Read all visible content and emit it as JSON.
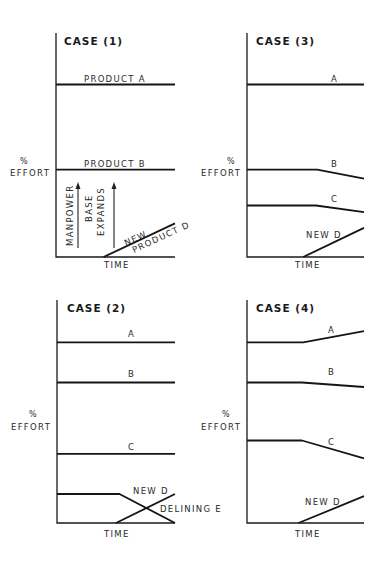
{
  "figure": {
    "y_label_symbol": "%",
    "y_label_text": "EFFORT",
    "x_label": "TIME",
    "note": "Time axis normalized 0..1; effort values normalized 0..1 of panel height"
  },
  "chart_data": [
    {
      "type": "line",
      "title": "CASE (1)",
      "xlabel": "TIME",
      "ylabel": "% EFFORT",
      "xlim": [
        0,
        1
      ],
      "ylim": [
        0,
        1
      ],
      "series": [
        {
          "name": "PRODUCT A",
          "label": "PRODUCT A",
          "points": [
            [
              0,
              0.77
            ],
            [
              1,
              0.77
            ]
          ]
        },
        {
          "name": "PRODUCT B",
          "label": "PRODUCT B",
          "points": [
            [
              0,
              0.39
            ],
            [
              1,
              0.39
            ]
          ]
        },
        {
          "name": "NEW PRODUCT D",
          "label_line1": "NEW",
          "label_line2": "PRODUCT D",
          "points": [
            [
              0.4,
              0
            ],
            [
              1,
              0.15
            ]
          ]
        }
      ],
      "annotations": [
        {
          "text": "MANPOWER",
          "arrow": "up"
        },
        {
          "text_line1": "BASE",
          "text_line2": "EXPANDS",
          "arrow": "up"
        }
      ]
    },
    {
      "type": "line",
      "title": "CASE (3)",
      "xlabel": "TIME",
      "ylabel": "% EFFORT",
      "xlim": [
        0,
        1
      ],
      "ylim": [
        0,
        1
      ],
      "series": [
        {
          "name": "A",
          "label": "A",
          "points": [
            [
              0,
              0.77
            ],
            [
              1,
              0.77
            ]
          ]
        },
        {
          "name": "B",
          "label": "B",
          "points": [
            [
              0,
              0.39
            ],
            [
              0.6,
              0.39
            ],
            [
              1,
              0.35
            ]
          ]
        },
        {
          "name": "C",
          "label": "C",
          "points": [
            [
              0,
              0.23
            ],
            [
              0.59,
              0.23
            ],
            [
              1,
              0.2
            ]
          ]
        },
        {
          "name": "NEW D",
          "label": "NEW D",
          "points": [
            [
              0.48,
              0
            ],
            [
              1,
              0.13
            ]
          ]
        }
      ]
    },
    {
      "type": "line",
      "title": "CASE (2)",
      "xlabel": "TIME",
      "ylabel": "% EFFORT",
      "xlim": [
        0,
        1
      ],
      "ylim": [
        0,
        1
      ],
      "series": [
        {
          "name": "A",
          "label": "A",
          "points": [
            [
              0,
              0.81
            ],
            [
              1,
              0.81
            ]
          ]
        },
        {
          "name": "B",
          "label": "B",
          "points": [
            [
              0,
              0.63
            ],
            [
              1,
              0.63
            ]
          ]
        },
        {
          "name": "C",
          "label": "C",
          "points": [
            [
              0,
              0.31
            ],
            [
              1,
              0.31
            ]
          ]
        },
        {
          "name": "NEW D",
          "label": "NEW D",
          "points": [
            [
              0.5,
              0
            ],
            [
              1,
              0.13
            ]
          ]
        },
        {
          "name": "DELINING E",
          "label": "DELINING E",
          "points": [
            [
              0,
              0.13
            ],
            [
              0.53,
              0.13
            ],
            [
              1,
              0
            ]
          ]
        }
      ]
    },
    {
      "type": "line",
      "title": "CASE (4)",
      "xlabel": "TIME",
      "ylabel": "% EFFORT",
      "xlim": [
        0,
        1
      ],
      "ylim": [
        0,
        1
      ],
      "series": [
        {
          "name": "A",
          "label": "A",
          "points": [
            [
              0,
              0.81
            ],
            [
              0.48,
              0.81
            ],
            [
              1,
              0.86
            ]
          ]
        },
        {
          "name": "B",
          "label": "B",
          "points": [
            [
              0,
              0.63
            ],
            [
              0.47,
              0.63
            ],
            [
              1,
              0.61
            ]
          ]
        },
        {
          "name": "C",
          "label": "C",
          "points": [
            [
              0,
              0.37
            ],
            [
              0.47,
              0.37
            ],
            [
              1,
              0.29
            ]
          ]
        },
        {
          "name": "NEW D",
          "label": "NEW D",
          "points": [
            [
              0.44,
              0
            ],
            [
              1,
              0.12
            ]
          ]
        }
      ]
    }
  ]
}
